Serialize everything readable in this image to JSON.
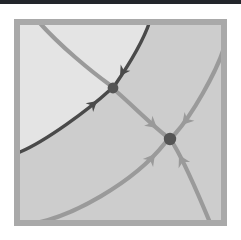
{
  "figure": {
    "kind": "phase-portrait",
    "canvas": {
      "width": 241,
      "height": 240
    },
    "background_color": "#ffffff"
  },
  "top_rule": {
    "label": "page-top-rule",
    "color": "#23262b",
    "x": 0,
    "y": 0,
    "width": 241,
    "height": 4
  },
  "plot_frame": {
    "label": "plot-frame",
    "x": 14,
    "y": 19,
    "width": 213,
    "height": 207,
    "stroke_color": "#a9a9a9",
    "stroke_width": 6
  },
  "regions": [
    {
      "name": "upper-left-light-region",
      "fill": "#e4e4e4",
      "description": "lighter basin above the separatrix"
    },
    {
      "name": "lower-right-shaded-region",
      "fill": "#cdcdcd",
      "description": "darker basin below the separatrix"
    }
  ],
  "colors": {
    "separatrix": "#4a4a4a",
    "trajectory": "#9a9a9a",
    "fixed_point": "#555555",
    "frame": "#a9a9a9",
    "region_light": "#e4e4e4",
    "region_dark": "#cdcdcd",
    "rule": "#23262b"
  },
  "stroke_widths": {
    "separatrix": 3.4,
    "trajectory": 4.2
  },
  "fixed_points": [
    {
      "name": "saddle-point",
      "label": "saddle",
      "cx": 113,
      "cy": 88,
      "r": 5.4,
      "color": "#555555",
      "stability": "saddle"
    },
    {
      "name": "stable-node",
      "label": "stable node",
      "cx": 170,
      "cy": 139,
      "r": 6.2,
      "color": "#555555",
      "stability": "stable"
    }
  ],
  "separatrix_curves": [
    {
      "name": "separatrix-incoming-from-top",
      "path": "M 150 21 C 143 42, 128 66, 115 85",
      "color": "#4a4a4a",
      "width": 3.4,
      "arrow": {
        "x": 120,
        "y": 76,
        "angle": 123
      }
    },
    {
      "name": "separatrix-incoming-from-left",
      "path": "M 20 152 C 46 141, 88 110, 110 90",
      "color": "#4a4a4a",
      "width": 3.4,
      "arrow": {
        "x": 97,
        "y": 101,
        "angle": -41
      }
    }
  ],
  "trajectory_curves": [
    {
      "name": "trajectory-topleft-to-saddle",
      "path": "M 38 21 C 60 46, 92 72, 110 85",
      "color": "#9a9a9a",
      "width": 4.2
    },
    {
      "name": "trajectory-saddle-to-node",
      "path": "M 117 92 C 133 106, 152 125, 165 135",
      "color": "#9a9a9a",
      "width": 4.2,
      "arrow": {
        "x": 157,
        "y": 128,
        "angle": 40
      }
    },
    {
      "name": "trajectory-right-edge-to-node",
      "path": "M 224 48 C 216 73, 192 115, 175 134",
      "color": "#9a9a9a",
      "width": 4.2,
      "arrow": {
        "x": 182,
        "y": 125,
        "angle": 131
      }
    },
    {
      "name": "trajectory-bottomleft-to-node",
      "path": "M 22 225 C 70 221, 136 180, 165 143",
      "color": "#9a9a9a",
      "width": 4.2,
      "arrow": {
        "x": 155,
        "y": 154,
        "angle": -52
      }
    },
    {
      "name": "trajectory-bottom-to-node",
      "path": "M 211 225 C 199 196, 183 160, 174 145",
      "color": "#9a9a9a",
      "width": 4.2,
      "arrow": {
        "x": 179,
        "y": 155,
        "angle": -118
      }
    }
  ],
  "chart_data": {
    "type": "scatter",
    "xlabel": "",
    "ylabel": "",
    "grid": false,
    "legend": null,
    "fixed_points": [
      {
        "name": "saddle",
        "x": 113,
        "y": 88,
        "type": "saddle"
      },
      {
        "name": "node",
        "x": 170,
        "y": 139,
        "type": "stable node"
      }
    ],
    "flow_directions": [
      "into saddle from top along separatrix",
      "into saddle from lower-left along separatrix",
      "saddle to node along unstable manifold",
      "into node from upper-right",
      "into node from lower-left",
      "into node from below"
    ]
  }
}
